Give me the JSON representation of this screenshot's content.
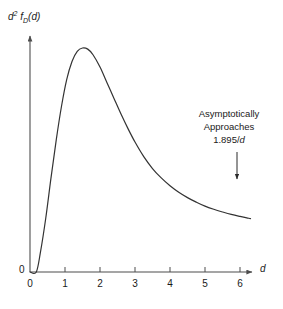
{
  "chart_data": {
    "type": "line",
    "title": "",
    "subtitle": "",
    "xlabel": "d",
    "ylabel": "d2 fD (d)",
    "ylabel_parts": {
      "base": "d",
      "exponent": "2",
      "function": "f",
      "function_subscript": "D",
      "argument": "(d)"
    },
    "grid": false,
    "legend": null,
    "xlim": [
      0,
      7.2
    ],
    "ylim": [
      0,
      1.0
    ],
    "xticks": [
      0,
      1,
      2,
      3,
      4,
      5,
      6
    ],
    "xtick_labels": [
      "0",
      "1",
      "2",
      "3",
      "4",
      "5",
      "6"
    ],
    "yticks": [
      0
    ],
    "ytick_labels": [
      "0"
    ],
    "x_axis_arrow": true,
    "y_axis_arrow": true,
    "series": [
      {
        "name": "d^2 f_D(d)",
        "color": "#333333",
        "x": [
          0.0,
          0.18,
          0.3,
          0.45,
          0.6,
          0.75,
          0.9,
          1.05,
          1.2,
          1.35,
          1.5,
          1.65,
          1.8,
          2.0,
          2.2,
          2.4,
          2.6,
          2.8,
          3.0,
          3.25,
          3.5,
          3.75,
          4.0,
          4.25,
          4.5,
          4.75,
          5.0,
          5.25,
          5.5,
          5.75,
          6.0,
          6.25,
          6.3
        ],
        "y": [
          0.0,
          0.0,
          0.09,
          0.24,
          0.42,
          0.59,
          0.74,
          0.86,
          0.94,
          0.985,
          1.0,
          0.995,
          0.97,
          0.915,
          0.845,
          0.775,
          0.705,
          0.64,
          0.58,
          0.515,
          0.462,
          0.42,
          0.385,
          0.356,
          0.332,
          0.312,
          0.294,
          0.28,
          0.268,
          0.257,
          0.248,
          0.24,
          0.238
        ]
      }
    ],
    "annotations": [
      {
        "name": "asymptote-note",
        "lines": [
          "Asymptotically",
          "Approaches",
          "1.895/d"
        ],
        "emphasis": "d",
        "value": "1.895/d",
        "arrow": {
          "from_x": 6.0,
          "from_y": 0.62,
          "to_x": 6.0,
          "to_y": 0.26
        }
      }
    ]
  },
  "axes": {
    "x_label": "d",
    "y_label_base": "d",
    "y_label_exponent": "2",
    "y_label_fn": "f",
    "y_label_fn_sub": "D",
    "y_label_arg": "(d)",
    "origin_y_label": "0",
    "origin_x_label": "0",
    "x_ticks": [
      {
        "value": "1",
        "px": 65
      },
      {
        "value": "2",
        "px": 100
      },
      {
        "value": "3",
        "px": 135
      },
      {
        "value": "4",
        "px": 170
      },
      {
        "value": "5",
        "px": 205
      },
      {
        "value": "6",
        "px": 240
      }
    ]
  },
  "annotation": {
    "line1": "Asymptotically",
    "line2": "Approaches",
    "line3_prefix": "1.895/",
    "line3_var": "d"
  },
  "colors": {
    "background": "#ffffff",
    "axis": "#4d4d4d",
    "curve": "#333333",
    "text": "#1a1a1a"
  }
}
